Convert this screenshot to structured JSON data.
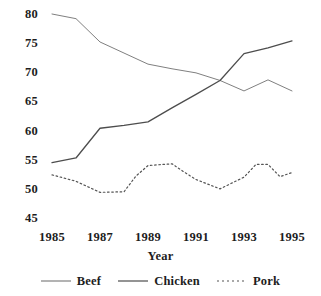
{
  "chart_data": {
    "type": "line",
    "title": "",
    "xlabel": "Year",
    "ylabel": "",
    "xlim": [
      1985,
      1995
    ],
    "ylim": [
      45,
      80
    ],
    "grid": false,
    "legend_position": "bottom",
    "x": [
      1985,
      1986,
      1987,
      1988,
      1989,
      1990,
      1991,
      1992,
      1993,
      1994,
      1995
    ],
    "xticks": [
      "1985",
      "1987",
      "1989",
      "1991",
      "1993",
      "1995"
    ],
    "xtick_values": [
      1985,
      1987,
      1989,
      1991,
      1993,
      1995
    ],
    "yticks": [
      "45",
      "50",
      "55",
      "60",
      "65",
      "70",
      "75",
      "80"
    ],
    "ytick_values": [
      45,
      50,
      55,
      60,
      65,
      70,
      75,
      80
    ],
    "series": [
      {
        "name": "Beef",
        "color": "#808080",
        "style": "solid",
        "width": 1,
        "values": [
          80.0,
          79.2,
          75.2,
          73.3,
          71.4,
          70.6,
          69.9,
          68.6,
          66.8,
          68.7,
          66.8
        ]
      },
      {
        "name": "Chicken",
        "color": "#4d4d4d",
        "style": "solid",
        "width": 1.3,
        "values": [
          54.5,
          55.3,
          60.4,
          60.9,
          61.5,
          63.9,
          66.2,
          68.6,
          73.2,
          74.2,
          75.4
        ]
      },
      {
        "name": "Pork",
        "color": "#555555",
        "style": "dotted",
        "width": 1.2,
        "values": [
          52.4,
          51.3,
          49.4,
          49.5,
          54.0,
          54.3,
          51.6,
          50.0,
          52.0,
          54.2,
          52.8
        ],
        "extra_points": [
          {
            "x": 1988.5,
            "y": 52.2
          },
          {
            "x": 1990.5,
            "y": 52.9
          },
          {
            "x": 1993.5,
            "y": 54.2
          },
          {
            "x": 1994.5,
            "y": 52.1
          }
        ]
      }
    ],
    "legend": [
      {
        "label": "Beef",
        "color": "#808080",
        "style": "solid"
      },
      {
        "label": "Chicken",
        "color": "#4d4d4d",
        "style": "solid"
      },
      {
        "label": "Pork",
        "color": "#555555",
        "style": "dotted"
      }
    ]
  }
}
